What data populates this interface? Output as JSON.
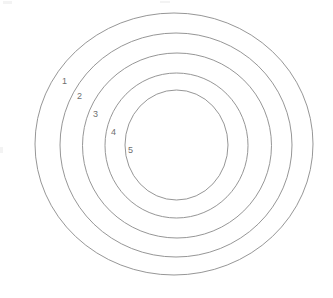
{
  "figure": {
    "background_color": "#ffffff",
    "stroke_color": "#8a8a8a",
    "label_color": "#6f6f6f",
    "canvas": {
      "width": 333,
      "height": 298
    }
  },
  "chart_data": {
    "type": "diagram",
    "subtype": "concentric-circles",
    "title": "",
    "xlabel": "",
    "ylabel": "",
    "grid": false,
    "legend": null,
    "annotations": [
      "1",
      "2",
      "3",
      "4",
      "5"
    ],
    "rings": [
      {
        "label": "1",
        "order": 1,
        "role": "outermost",
        "cx": 174.0,
        "cy": 144.0,
        "rx": 139.0,
        "ry": 131.0,
        "left": 35,
        "right": 313,
        "top": 13,
        "bottom": 275,
        "label_x": 62,
        "label_y": 76
      },
      {
        "label": "2",
        "order": 2,
        "role": "ring",
        "cx": 176.0,
        "cy": 145.0,
        "rx": 116.0,
        "ry": 112.0,
        "left": 60,
        "right": 292,
        "top": 33,
        "bottom": 257,
        "label_x": 77,
        "label_y": 91
      },
      {
        "label": "3",
        "order": 3,
        "role": "ring",
        "cx": 177.0,
        "cy": 145.5,
        "rx": 94.5,
        "ry": 92.5,
        "left": 83,
        "right": 272,
        "top": 53,
        "bottom": 238,
        "label_x": 93,
        "label_y": 109
      },
      {
        "label": "4",
        "order": 4,
        "role": "ring",
        "cx": 176.5,
        "cy": 145.5,
        "rx": 71.5,
        "ry": 72.5,
        "left": 105,
        "right": 248,
        "top": 73,
        "bottom": 218,
        "label_x": 111,
        "label_y": 127
      },
      {
        "label": "5",
        "order": 5,
        "role": "innermost",
        "cx": 176.5,
        "cy": 145.0,
        "rx": 51.5,
        "ry": 55.0,
        "left": 125,
        "right": 228,
        "top": 90,
        "bottom": 200,
        "label_x": 128,
        "label_y": 145
      }
    ]
  },
  "labels": {
    "ring_1": "1",
    "ring_2": "2",
    "ring_3": "3",
    "ring_4": "4",
    "ring_5": "5"
  }
}
